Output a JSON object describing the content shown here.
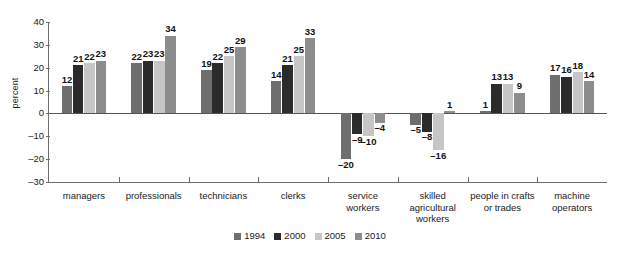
{
  "chart_data": {
    "type": "bar",
    "title": "",
    "subtitle": "",
    "xlabel": "",
    "ylabel": "percent",
    "ylim": [
      -30,
      40
    ],
    "yticks": [
      40,
      30,
      20,
      10,
      0,
      -10,
      -20,
      -30
    ],
    "ytick_labels": [
      "40",
      "30",
      "20",
      "10",
      "0",
      "–10",
      "–20",
      "–30"
    ],
    "grid": false,
    "legend_position": "bottom",
    "categories": [
      "managers",
      "professionals",
      "technicians",
      "clerks",
      "service workers",
      "skilled agricultural workers",
      "people in crafts or trades",
      "machine operators"
    ],
    "category_lines": [
      [
        "managers"
      ],
      [
        "professionals"
      ],
      [
        "technicians"
      ],
      [
        "clerks"
      ],
      [
        "service",
        "workers"
      ],
      [
        "skilled",
        "agricultural",
        "workers"
      ],
      [
        "people in crafts",
        "or trades"
      ],
      [
        "machine",
        "operators"
      ]
    ],
    "series": [
      {
        "name": "1994",
        "color": "#6e6e6e",
        "values": [
          12,
          22,
          19,
          14,
          -20,
          -5,
          1,
          17
        ],
        "labels": [
          "12",
          "22",
          "19",
          "14",
          "–20",
          "–5",
          "1",
          "17"
        ]
      },
      {
        "name": "2000",
        "color": "#2b2b2b",
        "values": [
          21,
          23,
          22,
          21,
          -9,
          -8,
          13,
          16
        ],
        "labels": [
          "21",
          "23",
          "22",
          "21",
          "–9",
          "–8",
          "13",
          "16"
        ]
      },
      {
        "name": "2005",
        "color": "#c6c6c6",
        "values": [
          22,
          23,
          25,
          25,
          -10,
          -16,
          13,
          18
        ],
        "labels": [
          "22",
          "23",
          "25",
          "25",
          "–10",
          "–16",
          "13",
          "18"
        ]
      },
      {
        "name": "2010",
        "color": "#8d8d8d",
        "values": [
          23,
          34,
          29,
          33,
          -4,
          1,
          9,
          14
        ],
        "labels": [
          "23",
          "34",
          "29",
          "33",
          "–4",
          "1",
          "9",
          "14"
        ]
      }
    ]
  },
  "legend": {
    "entries": [
      {
        "label": "1994",
        "color": "#6e6e6e"
      },
      {
        "label": "2000",
        "color": "#2b2b2b"
      },
      {
        "label": "2005",
        "color": "#c6c6c6"
      },
      {
        "label": "2010",
        "color": "#8d8d8d"
      }
    ]
  },
  "colors": {
    "axis": "#6d6d6d",
    "zero_line": "#555555",
    "text": "#1a1a1a",
    "background": "#ffffff"
  }
}
